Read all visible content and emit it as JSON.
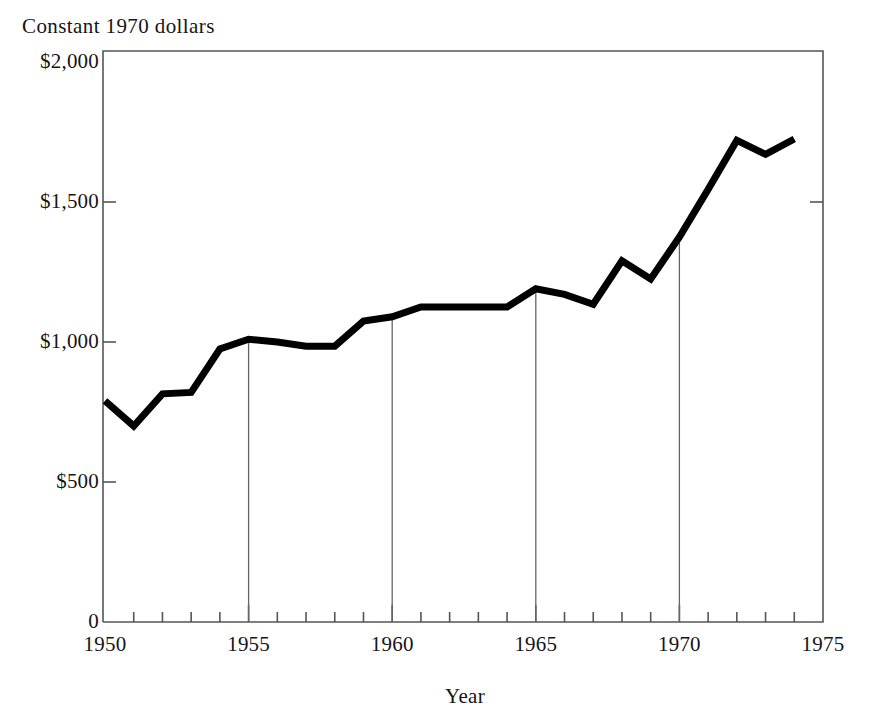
{
  "chart_data": {
    "type": "line",
    "title": "Constant 1970 dollars",
    "xlabel": "Year",
    "ylabel": "",
    "xlim": [
      1950,
      1975
    ],
    "ylim": [
      0,
      2000
    ],
    "grid": false,
    "legend": "none",
    "x": [
      1950,
      1951,
      1952,
      1953,
      1954,
      1955,
      1956,
      1957,
      1958,
      1959,
      1960,
      1961,
      1962,
      1963,
      1964,
      1965,
      1966,
      1967,
      1968,
      1969,
      1970,
      1971,
      1972,
      1973,
      1974
    ],
    "values": [
      790,
      700,
      815,
      820,
      975,
      1010,
      1000,
      985,
      985,
      1075,
      1090,
      1125,
      1125,
      1125,
      1125,
      1190,
      1170,
      1135,
      1290,
      1225,
      1375,
      1545,
      1720,
      1670,
      1725
    ],
    "series": [
      {
        "name": "Constant 1970 dollars",
        "values": [
          790,
          700,
          815,
          820,
          975,
          1010,
          1000,
          985,
          985,
          1075,
          1090,
          1125,
          1125,
          1125,
          1125,
          1190,
          1170,
          1135,
          1290,
          1225,
          1375,
          1545,
          1720,
          1670,
          1725
        ]
      }
    ],
    "y_ticks": [
      {
        "value": 2000,
        "label": "$2,000"
      },
      {
        "value": 1500,
        "label": "$1,500"
      },
      {
        "value": 1000,
        "label": "$1,000"
      },
      {
        "value": 500,
        "label": "$500"
      },
      {
        "value": 0,
        "label": "0"
      }
    ],
    "x_ticks_major": [
      {
        "value": 1950,
        "label": "1950"
      },
      {
        "value": 1955,
        "label": "1955"
      },
      {
        "value": 1960,
        "label": "1960"
      },
      {
        "value": 1965,
        "label": "1965"
      },
      {
        "value": 1970,
        "label": "1970"
      },
      {
        "value": 1975,
        "label": "1975"
      }
    ],
    "x_ticks_minor": [
      1951,
      1952,
      1953,
      1954,
      1956,
      1957,
      1958,
      1959,
      1961,
      1962,
      1963,
      1964,
      1966,
      1967,
      1968,
      1969,
      1971,
      1972,
      1973,
      1974
    ],
    "drop_lines": [
      1955,
      1960,
      1965,
      1970
    ],
    "colors": {
      "line": "#000000",
      "frame": "#555555",
      "drop_line": "#666666",
      "text": "#151515",
      "background": "#ffffff"
    }
  },
  "geometry": {
    "plot_left": 103,
    "plot_right": 823,
    "plot_top": 51,
    "plot_bottom": 622,
    "y_zero_px": 622,
    "y_top_value_px": 62,
    "y_top_value": 2000,
    "x_min_px": 105,
    "x_max_px": 823,
    "line_width": 7
  }
}
